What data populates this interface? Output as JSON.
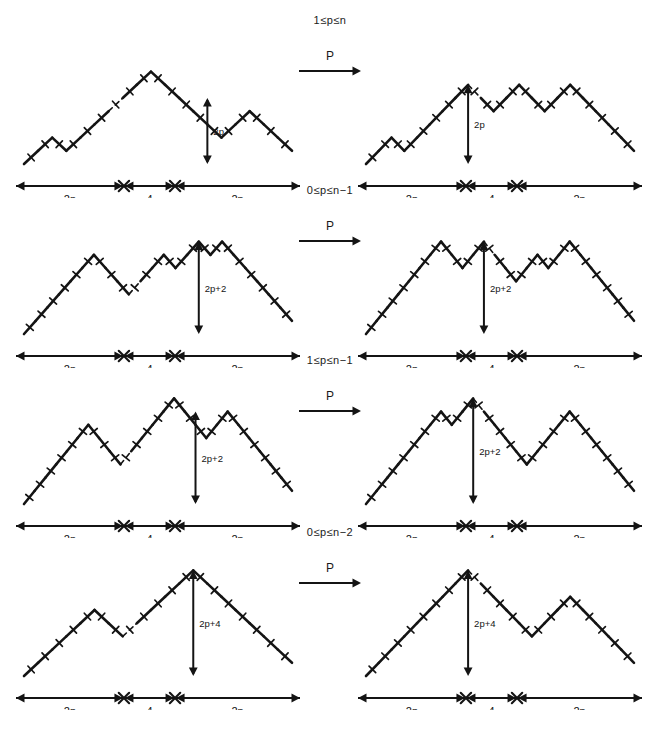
{
  "figure": {
    "ink_color": "#141414",
    "background": "#ffffff"
  },
  "arrow": {
    "label": "P",
    "glyph": "long-right-arrow"
  },
  "baseline": {
    "segments": [
      "2n",
      "4",
      "2n"
    ],
    "marker": "x-junction"
  },
  "rows": [
    {
      "condition": "1≤p≤n",
      "height_label": "2p",
      "left": {
        "name": "path-row1-left",
        "profile": [
          0,
          1,
          2,
          1,
          2,
          3,
          4,
          5,
          6,
          7,
          6,
          5,
          4,
          3,
          2,
          3,
          4,
          3,
          2,
          1
        ],
        "dashed_index": 6,
        "arrow_at": 13,
        "arrow_top": 5
      },
      "right": {
        "name": "path-row1-right",
        "profile": [
          0,
          1,
          2,
          1,
          2,
          3,
          4,
          5,
          6,
          5,
          4,
          5,
          6,
          5,
          4,
          5,
          6,
          5,
          4,
          3,
          2,
          1
        ],
        "dashed_index": 8,
        "arrow_at": 8,
        "arrow_top": 6
      }
    },
    {
      "condition": "0≤p≤n−1",
      "height_label": "2p+2",
      "left": {
        "name": "path-row2-left",
        "profile": [
          0,
          1,
          2,
          3,
          4,
          5,
          6,
          5,
          4,
          3,
          4,
          5,
          6,
          5,
          6,
          7,
          6,
          7,
          6,
          5,
          4,
          3,
          2,
          1
        ],
        "dashed_index": 9,
        "arrow_at": 15,
        "arrow_top": 7
      },
      "right": {
        "name": "path-row2-right",
        "profile": [
          0,
          1,
          2,
          3,
          4,
          5,
          6,
          7,
          6,
          5,
          6,
          7,
          6,
          5,
          4,
          5,
          6,
          5,
          6,
          7,
          6,
          5,
          4,
          3,
          2,
          1
        ],
        "dashed_index": 11,
        "arrow_at": 11,
        "arrow_top": 7
      }
    },
    {
      "condition": "1≤p≤n−1",
      "height_label": "2p+2",
      "left": {
        "name": "path-row3-left",
        "profile": [
          0,
          1,
          2,
          3,
          4,
          5,
          6,
          5,
          4,
          3,
          4,
          5,
          6,
          7,
          8,
          7,
          6,
          5,
          6,
          7,
          6,
          5,
          4,
          3,
          2,
          1
        ],
        "dashed_index": 9,
        "arrow_at": 16,
        "arrow_top": 7
      },
      "right": {
        "name": "path-row3-right",
        "profile": [
          0,
          1,
          2,
          3,
          4,
          5,
          6,
          7,
          6,
          7,
          8,
          7,
          6,
          5,
          4,
          3,
          4,
          5,
          6,
          7,
          6,
          5,
          4,
          3,
          2,
          1
        ],
        "dashed_index": 10,
        "arrow_at": 10,
        "arrow_top": 8
      }
    },
    {
      "condition": "0≤p≤n−2",
      "height_label": "2p+4",
      "left": {
        "name": "path-row4-left",
        "profile": [
          0,
          1,
          2,
          3,
          4,
          5,
          4,
          3,
          4,
          5,
          6,
          7,
          8,
          7,
          6,
          5,
          4,
          3,
          2,
          1
        ],
        "dashed_index": 7,
        "arrow_at": 12,
        "arrow_top": 8
      },
      "right": {
        "name": "path-row4-right",
        "profile": [
          0,
          1,
          2,
          3,
          4,
          5,
          6,
          7,
          8,
          7,
          6,
          5,
          4,
          3,
          4,
          5,
          6,
          5,
          4,
          3,
          2,
          1
        ],
        "dashed_index": 8,
        "arrow_at": 8,
        "arrow_top": 8
      }
    }
  ]
}
